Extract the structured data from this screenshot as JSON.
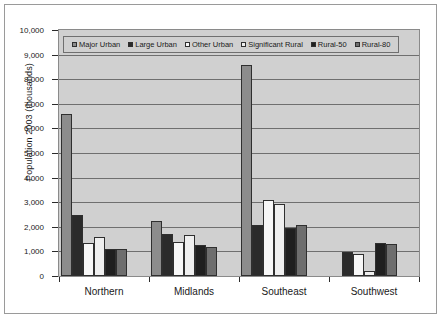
{
  "chart_data": {
    "type": "bar",
    "title": "",
    "xlabel": "",
    "ylabel": "Population 2003 (thousands)",
    "ylim": [
      0,
      10000
    ],
    "ytick_labels": [
      "10,000",
      "9,000",
      "8,000",
      "7,000",
      "6,000",
      "5,000",
      "4,000",
      "3,000",
      "2,000",
      "1,000",
      "0"
    ],
    "ytick_values": [
      10000,
      9000,
      8000,
      7000,
      6000,
      5000,
      4000,
      3000,
      2000,
      1000,
      0
    ],
    "grid": true,
    "legend_position": "top-inside-left",
    "categories": [
      "Northern",
      "Midlands",
      "Southeast",
      "Southwest"
    ],
    "series": [
      {
        "name": "Major Urban",
        "color": "#8c8c8c",
        "values": [
          6600,
          2250,
          8560,
          0
        ]
      },
      {
        "name": "Large Urban",
        "color": "#2b2b2b",
        "values": [
          2500,
          1690,
          2070,
          960
        ]
      },
      {
        "name": "Other Urban",
        "color": "#f7f7f7",
        "values": [
          1350,
          1390,
          3070,
          900
        ]
      },
      {
        "name": "Significant Rural",
        "color": "#efefef",
        "values": [
          1570,
          1650,
          2940,
          210
        ]
      },
      {
        "name": "Rural-50",
        "color": "#1f1f1f",
        "values": [
          1080,
          1250,
          1960,
          1350
        ]
      },
      {
        "name": "Rural-80",
        "color": "#6e6e6e",
        "values": [
          1080,
          1160,
          2080,
          1320
        ]
      }
    ]
  }
}
